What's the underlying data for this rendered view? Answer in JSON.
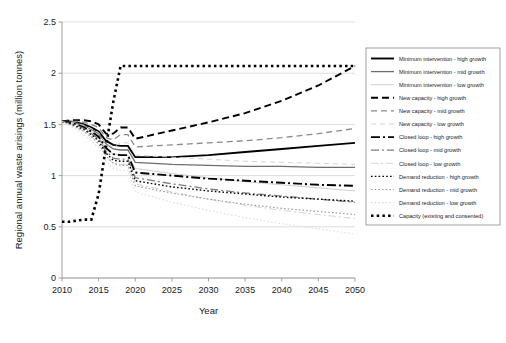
{
  "chart_data": {
    "type": "line",
    "title": "",
    "xlabel": "Year",
    "ylabel": "Regional annual waste arisings (million tonnes)",
    "xlim": [
      2010,
      2050
    ],
    "ylim": [
      0,
      2.5
    ],
    "xticks": [
      2010,
      2015,
      2020,
      2025,
      2030,
      2035,
      2040,
      2045,
      2050
    ],
    "yticks": [
      0,
      0.5,
      1,
      1.5,
      2,
      2.5
    ],
    "ytick_labels": [
      "0",
      "0.5",
      "1",
      "1.5",
      "2",
      "2.5"
    ],
    "grid": "horizontal",
    "legend_position": "right-outside",
    "x": [
      2010,
      2011,
      2012,
      2013,
      2014,
      2015,
      2016,
      2017,
      2018,
      2019,
      2020,
      2025,
      2030,
      2035,
      2040,
      2045,
      2050
    ],
    "series": [
      {
        "name": "Minimum intervention - high growth",
        "color": "#000000",
        "width": 1.9,
        "dash": "none",
        "values": [
          1.53,
          1.53,
          1.52,
          1.5,
          1.47,
          1.43,
          1.34,
          1.3,
          1.29,
          1.29,
          1.18,
          1.18,
          1.2,
          1.23,
          1.26,
          1.29,
          1.32
        ]
      },
      {
        "name": "Minimum intervention - mid growth",
        "color": "#6e6e6e",
        "width": 1.3,
        "dash": "none",
        "values": [
          1.53,
          1.53,
          1.51,
          1.49,
          1.45,
          1.41,
          1.31,
          1.26,
          1.25,
          1.25,
          1.13,
          1.11,
          1.1,
          1.09,
          1.09,
          1.08,
          1.08
        ]
      },
      {
        "name": "Minimum intervention - low growth",
        "color": "#cfcfcf",
        "width": 1.0,
        "dash": "none",
        "values": [
          1.53,
          1.52,
          1.5,
          1.47,
          1.43,
          1.38,
          1.27,
          1.21,
          1.2,
          1.2,
          1.07,
          1.02,
          0.98,
          0.94,
          0.91,
          0.88,
          0.85
        ]
      },
      {
        "name": "New capacity - high growth",
        "color": "#000000",
        "width": 1.9,
        "dash": "7,4",
        "values": [
          1.53,
          1.54,
          1.54,
          1.54,
          1.53,
          1.5,
          1.41,
          1.41,
          1.47,
          1.47,
          1.36,
          1.44,
          1.52,
          1.61,
          1.73,
          1.88,
          2.07
        ]
      },
      {
        "name": "New capacity - mid growth",
        "color": "#8a8a8a",
        "width": 1.3,
        "dash": "6,4",
        "values": [
          1.53,
          1.53,
          1.53,
          1.52,
          1.5,
          1.47,
          1.37,
          1.35,
          1.4,
          1.4,
          1.28,
          1.3,
          1.32,
          1.34,
          1.37,
          1.41,
          1.46
        ]
      },
      {
        "name": "New capacity - low growth",
        "color": "#d4d4d4",
        "width": 1.0,
        "dash": "5,4",
        "values": [
          1.53,
          1.52,
          1.51,
          1.49,
          1.46,
          1.42,
          1.31,
          1.28,
          1.32,
          1.32,
          1.2,
          1.18,
          1.16,
          1.14,
          1.13,
          1.12,
          1.11
        ]
      },
      {
        "name": "Closed loop - high growth",
        "color": "#000000",
        "width": 1.9,
        "dash": "9,3,2,3",
        "values": [
          1.53,
          1.52,
          1.5,
          1.47,
          1.43,
          1.38,
          1.27,
          1.21,
          1.2,
          1.2,
          1.03,
          1.0,
          0.97,
          0.95,
          0.93,
          0.91,
          0.9
        ]
      },
      {
        "name": "Closed loop - mid growth",
        "color": "#7d7d7d",
        "width": 1.3,
        "dash": "8,3,2,3",
        "values": [
          1.53,
          1.51,
          1.49,
          1.46,
          1.41,
          1.36,
          1.24,
          1.17,
          1.16,
          1.16,
          0.98,
          0.92,
          0.87,
          0.83,
          0.8,
          0.77,
          0.74
        ]
      },
      {
        "name": "Closed loop - low growth",
        "color": "#d4d4d4",
        "width": 1.0,
        "dash": "7,3,2,3",
        "values": [
          1.53,
          1.5,
          1.47,
          1.43,
          1.38,
          1.32,
          1.19,
          1.12,
          1.11,
          1.11,
          0.92,
          0.84,
          0.77,
          0.71,
          0.66,
          0.62,
          0.58
        ]
      },
      {
        "name": "Demand reduction - high growth",
        "color": "#000000",
        "width": 1.4,
        "dash": "1.6,2.2",
        "values": [
          1.53,
          1.51,
          1.48,
          1.45,
          1.4,
          1.34,
          1.22,
          1.15,
          1.14,
          1.14,
          0.95,
          0.89,
          0.85,
          0.82,
          0.79,
          0.77,
          0.75
        ]
      },
      {
        "name": "Demand reduction - mid growth",
        "color": "#9a9a9a",
        "width": 1.2,
        "dash": "1.5,2.2",
        "values": [
          1.53,
          1.5,
          1.47,
          1.43,
          1.38,
          1.31,
          1.19,
          1.12,
          1.1,
          1.1,
          0.9,
          0.83,
          0.77,
          0.72,
          0.68,
          0.65,
          0.62
        ]
      },
      {
        "name": "Demand reduction - low growth",
        "color": "#dcdcdc",
        "width": 1.1,
        "dash": "1.5,2.2",
        "values": [
          1.53,
          1.49,
          1.45,
          1.4,
          1.34,
          1.27,
          1.14,
          1.07,
          1.05,
          1.05,
          0.84,
          0.74,
          0.66,
          0.59,
          0.53,
          0.48,
          0.43
        ]
      },
      {
        "name": "Capacity (existing and consented)",
        "color": "#000000",
        "width": 2.6,
        "dash": "2.5,3.2",
        "values": [
          0.55,
          0.55,
          0.56,
          0.57,
          0.57,
          0.82,
          1.28,
          1.72,
          2.07,
          2.07,
          2.07,
          2.07,
          2.07,
          2.07,
          2.07,
          2.07,
          2.07
        ]
      }
    ]
  },
  "legend": {
    "items": [
      {
        "label": "Minimum intervention - high growth"
      },
      {
        "label": "Minimum intervention - mid growth"
      },
      {
        "label": "Minimum intervention - low growth"
      },
      {
        "label": "New capacity - high growth"
      },
      {
        "label": "New capacity - mid growth"
      },
      {
        "label": "New capacity - low growth"
      },
      {
        "label": "Closed loop - high growth"
      },
      {
        "label": "Closed loop - mid growth"
      },
      {
        "label": "Closed loop - low growth"
      },
      {
        "label": "Demand reduction - high growth"
      },
      {
        "label": "Demand reduction - mid growth"
      },
      {
        "label": "Demand reduction - low growth"
      },
      {
        "label": "Capacity (existing and consented)"
      }
    ]
  }
}
